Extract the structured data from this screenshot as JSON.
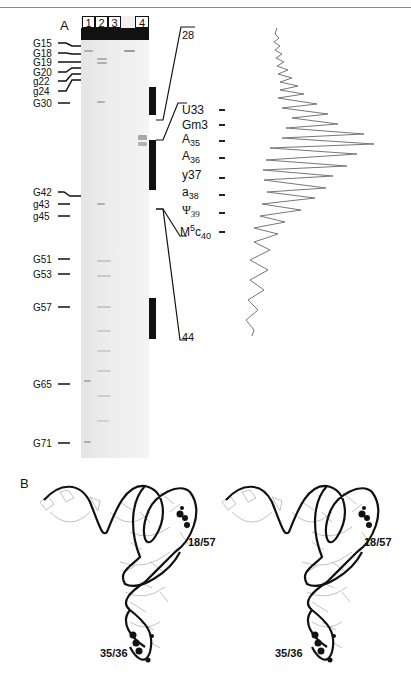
{
  "panel_a": {
    "label": "A",
    "lanes": [
      "1",
      "2",
      "3",
      "4"
    ],
    "left_markers": [
      {
        "label": "G15",
        "y": 43
      },
      {
        "label": "G18",
        "y": 53
      },
      {
        "label": "G19",
        "y": 62
      },
      {
        "label": "G20",
        "y": 72
      },
      {
        "label": "g22",
        "y": 81
      },
      {
        "label": "g24",
        "y": 91
      },
      {
        "label": "G30",
        "y": 103
      },
      {
        "label": "G42",
        "y": 192
      },
      {
        "label": "g43",
        "y": 204
      },
      {
        "label": "g45",
        "y": 216
      },
      {
        "label": "G51",
        "y": 259
      },
      {
        "label": "G53",
        "y": 274
      },
      {
        "label": "G57",
        "y": 307
      },
      {
        "label": "G65",
        "y": 384
      },
      {
        "label": "G71",
        "y": 443
      }
    ],
    "bracket_top_label": "28",
    "bracket_bottom_label": "44",
    "trace_labels": [
      {
        "base": "U",
        "num": "33",
        "style": "plain"
      },
      {
        "base": "Gm",
        "num": "3",
        "style": "plain"
      },
      {
        "base": "A",
        "num": "35",
        "style": "sub"
      },
      {
        "base": "A",
        "num": "36",
        "style": "sub"
      },
      {
        "base": "y",
        "num": "37",
        "style": "plain"
      },
      {
        "base": "a",
        "num": "38",
        "style": "sub"
      },
      {
        "base": "Ψ",
        "num": "39",
        "style": "sub"
      },
      {
        "base": "M",
        "sup": "5",
        "base2": "c",
        "num": "40",
        "style": "sup-sub"
      }
    ]
  },
  "panel_b": {
    "label": "B",
    "left_annotations": {
      "top": "18/57",
      "bottom": "35/36"
    },
    "right_annotations": {
      "top": "18/57",
      "bottom": "35/36"
    }
  }
}
